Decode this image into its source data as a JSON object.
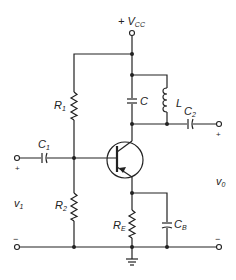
{
  "diagram": {
    "type": "circuit-schematic",
    "labels": {
      "vcc": {
        "prefix": "+ V",
        "sub": "CC"
      },
      "r1": {
        "main": "R",
        "sub": "1"
      },
      "r2": {
        "main": "R",
        "sub": "2"
      },
      "re": {
        "main": "R",
        "sub": "E"
      },
      "c": {
        "main": "C"
      },
      "l": {
        "main": "L"
      },
      "c1": {
        "main": "C",
        "sub": "1"
      },
      "c2": {
        "main": "C",
        "sub": "2"
      },
      "cb": {
        "main": "C",
        "sub": "B"
      },
      "v1": {
        "main": "v",
        "sub": "1"
      },
      "v0": {
        "main": "v",
        "sub": "0"
      },
      "in_plus": "+",
      "in_minus": "−",
      "out_plus": "+",
      "out_minus": "−"
    },
    "components": [
      "Vcc supply",
      "R1",
      "R2",
      "RE",
      "C",
      "L",
      "C1",
      "C2",
      "CB",
      "PNP transistor",
      "ground"
    ]
  }
}
